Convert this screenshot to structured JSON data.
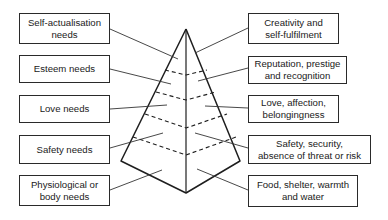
{
  "diagram": {
    "levels": [
      {
        "need": "Self-actualisation\nneeds",
        "example": "Creativity and\nself-fulfilment"
      },
      {
        "need": "Esteem needs",
        "example": "Reputation, prestige\nand recognition"
      },
      {
        "need": "Love needs",
        "example": "Love, affection,\nbelongingness"
      },
      {
        "need": "Safety needs",
        "example": "Safety, security,\nabsence of threat or risk"
      },
      {
        "need": "Physiological or\nbody needs",
        "example": "Food, shelter, warmth\nand water"
      }
    ],
    "colors": {
      "line": "#1e1e1e",
      "connector": "#333333",
      "background": "#ffffff"
    }
  }
}
